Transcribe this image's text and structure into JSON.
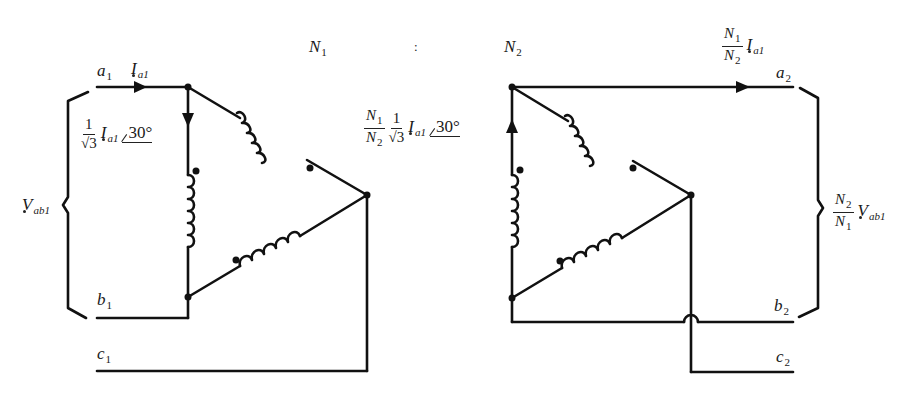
{
  "diagram": {
    "type": "three-phase delta-delta transformer circuit",
    "ratio": {
      "primary_turns": "N",
      "primary_turns_sub": "1",
      "separator": ":",
      "secondary_turns": "N",
      "secondary_turns_sub": "2"
    },
    "primary": {
      "terminals": [
        {
          "letter": "a",
          "sub": "1"
        },
        {
          "letter": "b",
          "sub": "1"
        },
        {
          "letter": "c",
          "sub": "1"
        }
      ],
      "line_current": {
        "symbol": "I",
        "sub": "a1"
      },
      "phase_current": {
        "coef_num": "1",
        "coef_den": "√3",
        "symbol": "I",
        "sub": "a1",
        "angle": "30°"
      },
      "voltage": {
        "symbol": "V",
        "sub": "ab1"
      }
    },
    "secondary": {
      "terminals": [
        {
          "letter": "a",
          "sub": "2"
        },
        {
          "letter": "b",
          "sub": "2"
        },
        {
          "letter": "c",
          "sub": "2"
        }
      ],
      "line_current": {
        "ratio_num": "N",
        "ratio_num_sub": "1",
        "ratio_den": "N",
        "ratio_den_sub": "2",
        "symbol": "I",
        "sub": "a1"
      },
      "phase_current": {
        "ratio_num": "N",
        "ratio_num_sub": "1",
        "ratio_den": "N",
        "ratio_den_sub": "2",
        "coef_num": "1",
        "coef_den": "√3",
        "symbol": "I",
        "sub": "a1",
        "angle": "30°"
      },
      "voltage": {
        "ratio_num": "N",
        "ratio_num_sub": "2",
        "ratio_den": "N",
        "ratio_den_sub": "1",
        "symbol": "V",
        "sub": "ab1"
      }
    },
    "colors": {
      "line": "#111111",
      "background": "#ffffff"
    }
  }
}
